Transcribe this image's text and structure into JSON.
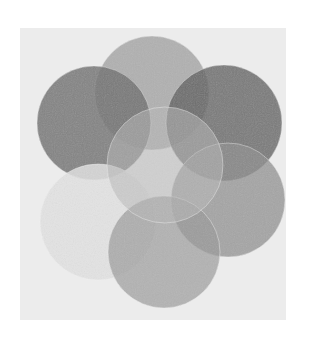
{
  "image": {
    "subject": "overlapping circles rosette (seed of life pattern)",
    "caption": "Grayscale rosette of seven overlapping circles",
    "background": "#ffffff",
    "panel": {
      "x": 20,
      "y": 28,
      "width": 266,
      "height": 292,
      "fill": "#ececec"
    },
    "circles": [
      {
        "name": "top",
        "cx": 152,
        "cy": 93,
        "r": 57,
        "fill": "#9c9c9c",
        "opacity": 0.75
      },
      {
        "name": "upper-left",
        "cx": 94,
        "cy": 123,
        "r": 57,
        "fill": "#6e6e6e",
        "opacity": 0.82
      },
      {
        "name": "upper-right",
        "cx": 224,
        "cy": 123,
        "r": 58,
        "fill": "#5e5e5e",
        "opacity": 0.8
      },
      {
        "name": "right",
        "cx": 228,
        "cy": 200,
        "r": 57,
        "fill": "#8e8e8e",
        "opacity": 0.75
      },
      {
        "name": "lower-left",
        "cx": 98,
        "cy": 222,
        "r": 58,
        "fill": "#e2e2e2",
        "opacity": 0.85
      },
      {
        "name": "bottom",
        "cx": 164,
        "cy": 252,
        "r": 56,
        "fill": "#9a9a9a",
        "opacity": 0.7
      },
      {
        "name": "center",
        "cx": 165,
        "cy": 165,
        "r": 58,
        "fill": "#b8b8b8",
        "opacity": 0.55
      }
    ]
  }
}
